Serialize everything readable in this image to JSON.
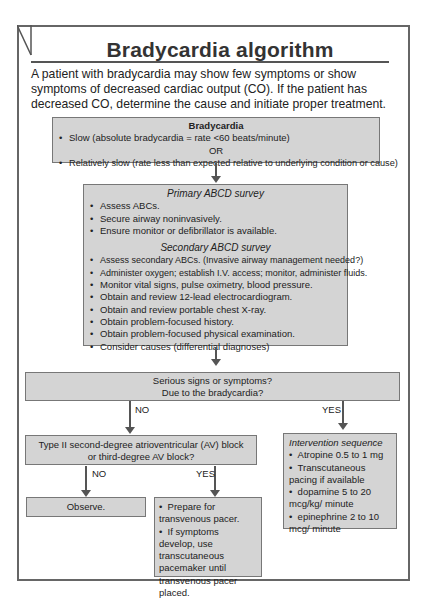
{
  "title": "Bradycardia algorithm",
  "intro": "A patient with bradycardia may show few symptoms or show symptoms of decreased cardiac output (CO). If the patient has decreased CO, determine the cause and initiate proper treatment.",
  "bradycardia_box": {
    "heading": "Bradycardia",
    "item1": "Slow (absolute bradycardia = rate <60 beats/minute)",
    "or": "OR",
    "item2": "Relatively slow (rate less than expected relative to underlying condition or cause)"
  },
  "survey_box": {
    "primary_heading": "Primary ABCD survey",
    "primary_items": [
      "Assess ABCs.",
      "Secure airway noninvasively.",
      "Ensure monitor or defibrillator is available."
    ],
    "secondary_heading": "Secondary ABCD survey",
    "secondary_items": [
      "Assess secondary ABCs. (Invasive airway management needed?)",
      "Administer oxygen; establish I.V. access; monitor, administer fluids.",
      "Monitor vital signs, pulse oximetry, blood pressure.",
      "Obtain and review 12-lead electrocardiogram.",
      "Obtain and review portable chest X-ray.",
      "Obtain problem-focused history.",
      "Obtain problem-focused physical examination.",
      "Consider causes (differential diagnoses)"
    ]
  },
  "serious_box": {
    "line1": "Serious signs or symptoms?",
    "line2": "Due to the bradycardia?"
  },
  "labels": {
    "no": "NO",
    "yes": "YES"
  },
  "av_block_box": {
    "line1": "Type II second-degree atrioventricular (AV) block",
    "line2": "or third-degree AV block?"
  },
  "observe_box": {
    "text": "Observe."
  },
  "pacer_box": {
    "items": [
      "Prepare for transvenous pacer.",
      "If symptoms develop, use transcutaneous pacemaker until transvenous pacer placed."
    ]
  },
  "intervention_box": {
    "heading": "Intervention sequence",
    "items": [
      "Atropine 0.5 to 1 mg",
      "Transcutaneous pacing if available",
      "dopamine 5 to 20 mcg/kg/ minute",
      "epinephrine 2 to 10 mcg/ minute"
    ]
  }
}
